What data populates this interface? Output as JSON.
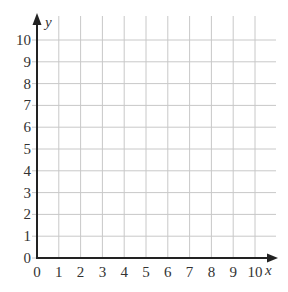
{
  "chart_data": {
    "type": "scatter",
    "title": "",
    "xlabel": "x",
    "ylabel": "y",
    "xlim": [
      0,
      10
    ],
    "ylim": [
      0,
      10
    ],
    "x_ticks": [
      "0",
      "1",
      "2",
      "3",
      "4",
      "5",
      "6",
      "7",
      "8",
      "9",
      "10"
    ],
    "y_ticks": [
      "0",
      "1",
      "2",
      "3",
      "4",
      "5",
      "6",
      "7",
      "8",
      "9",
      "10"
    ],
    "grid": true,
    "series": [],
    "legend": null
  },
  "colors": {
    "axis": "#222222",
    "grid": "#c8c8c8",
    "text": "#333333",
    "background": "#ffffff"
  }
}
